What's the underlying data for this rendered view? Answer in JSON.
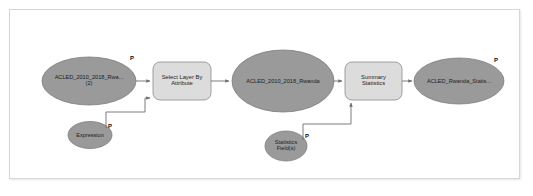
{
  "diagram": {
    "type": "geoprocessing-model",
    "colors": {
      "data_ellipse_fill": "#9a9a9a",
      "data_ellipse_stroke": "#777777",
      "tool_box_fill": "#dcdcdc",
      "tool_box_stroke": "#8c8c8c",
      "connector": "#6e6e6e",
      "frame_border": "#d6d6d6",
      "canvas_background": "#ffffff",
      "label_text": "#1c1c1c"
    },
    "nodes": [
      {
        "id": "input-layer",
        "kind": "data-ellipse",
        "label": "ACLED_2010_2018_Rwa...\n(2)",
        "parameter_badge": "P"
      },
      {
        "id": "select-layer-by-attribute",
        "kind": "tool-box",
        "label": "Select Layer By\nAttribute",
        "parameter_badge": ""
      },
      {
        "id": "expression",
        "kind": "data-ellipse",
        "label": "Expression",
        "parameter_badge": "P"
      },
      {
        "id": "selected-layer",
        "kind": "data-ellipse",
        "label": "ACLED_2010_2018_Rwanda",
        "parameter_badge": ""
      },
      {
        "id": "statistics-fields",
        "kind": "data-ellipse",
        "label": "Statistics\nField(s)",
        "parameter_badge": "P"
      },
      {
        "id": "summary-statistics",
        "kind": "tool-box",
        "label": "Summary\nStatistics",
        "parameter_badge": ""
      },
      {
        "id": "output-table",
        "kind": "data-ellipse",
        "label": "ACLED_Rwanda_Statis...",
        "parameter_badge": "P"
      }
    ],
    "connections": [
      {
        "from": "input-layer",
        "to": "select-layer-by-attribute",
        "style": "straight-arrow"
      },
      {
        "from": "expression",
        "to": "select-layer-by-attribute",
        "style": "elbow-arrow"
      },
      {
        "from": "select-layer-by-attribute",
        "to": "selected-layer",
        "style": "straight-arrow"
      },
      {
        "from": "selected-layer",
        "to": "summary-statistics",
        "style": "straight-arrow"
      },
      {
        "from": "statistics-fields",
        "to": "summary-statistics",
        "style": "elbow-arrow"
      },
      {
        "from": "summary-statistics",
        "to": "output-table",
        "style": "straight-arrow"
      }
    ]
  }
}
